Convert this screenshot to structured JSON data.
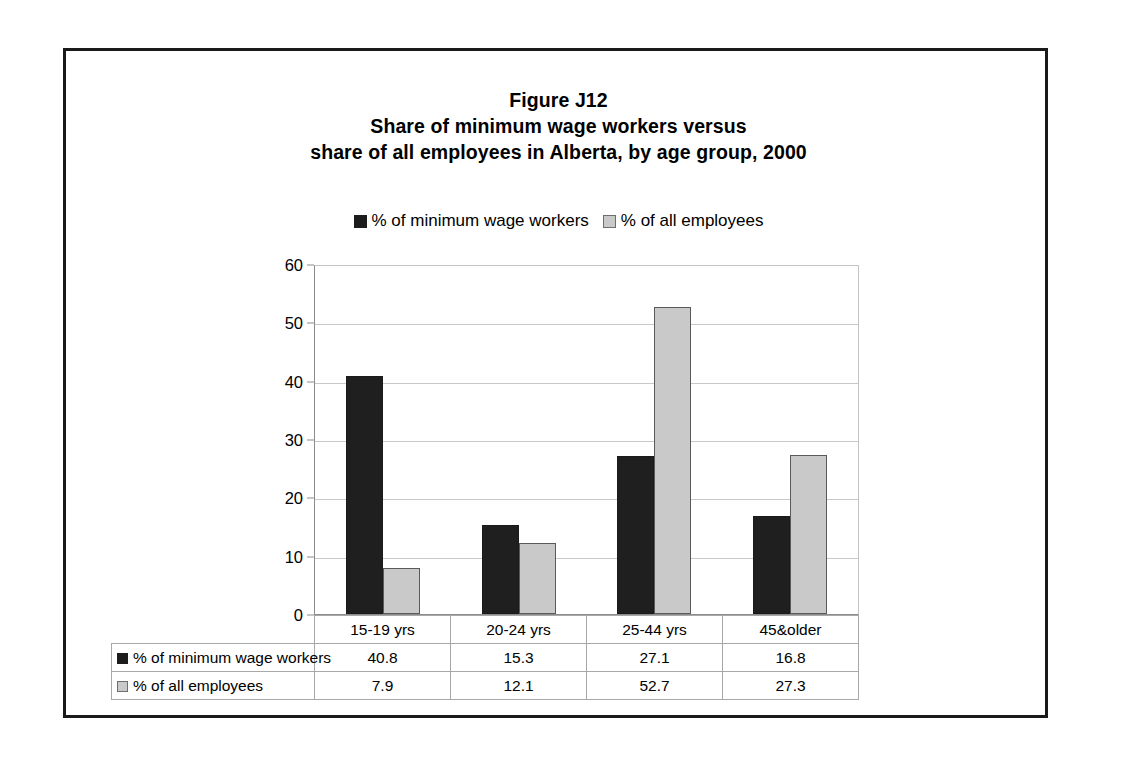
{
  "figure": {
    "title_lines": [
      "Figure J12",
      "Share of minimum wage workers versus",
      "share of all employees in Alberta, by age group, 2000"
    ]
  },
  "legend": {
    "entries": [
      {
        "label": "% of minimum wage workers",
        "swatch": "dark-square-icon",
        "color": "#1c1c1c"
      },
      {
        "label": "% of all employees",
        "swatch": "light-square-icon",
        "color": "#c9c9c9"
      }
    ]
  },
  "axis": {
    "y_ticks": [
      "60",
      "50",
      "40",
      "30",
      "20",
      "10",
      "0"
    ]
  },
  "table": {
    "corner_label": "",
    "category_header": [
      "15-19 yrs",
      "20-24 yrs",
      "25-44 yrs",
      "45&older"
    ],
    "rows": [
      {
        "key_color": "#1f1f1f",
        "label": "% of minimum wage workers",
        "values": [
          "40.8",
          "15.3",
          "27.1",
          "16.8"
        ]
      },
      {
        "key_color": "#c9c9c9",
        "label": "% of all employees",
        "values": [
          "7.9",
          "12.1",
          "52.7",
          "27.3"
        ]
      }
    ]
  },
  "chart_data": {
    "type": "bar",
    "subtitle": "",
    "xlabel": "",
    "ylabel": "",
    "categories": [
      "15-19 yrs",
      "20-24 yrs",
      "25-44 yrs",
      "45&older"
    ],
    "series": [
      {
        "name": "% of minimum wage workers",
        "values": [
          40.8,
          15.3,
          27.1,
          16.8
        ],
        "color": "#1f1f1f"
      },
      {
        "name": "% of all employees",
        "values": [
          7.9,
          12.1,
          52.7,
          27.3
        ],
        "color": "#c9c9c9"
      }
    ],
    "ylim": [
      0,
      60
    ],
    "ytick_step": 10,
    "grid": true,
    "legend_position": "top"
  }
}
